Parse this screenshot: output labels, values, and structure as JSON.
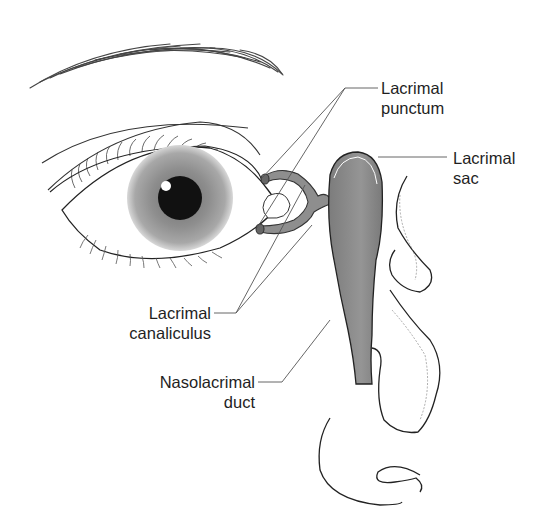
{
  "diagram": {
    "labels": {
      "lacrimal_punctum": {
        "line1": "Lacrimal",
        "line2": "punctum"
      },
      "lacrimal_sac": {
        "line1": "Lacrimal",
        "line2": "sac"
      },
      "lacrimal_canaliculus": {
        "line1": "Lacrimal",
        "line2": "canaliculus"
      },
      "nasolacrimal_duct": {
        "line1": "Nasolacrimal",
        "line2": "duct"
      }
    },
    "colors": {
      "line": "#2a2a2a",
      "leader": "#555555",
      "iris": "#8c8c8c",
      "pupil": "#111111",
      "duct_fill": "#8a8a8a",
      "background": "#ffffff"
    }
  }
}
